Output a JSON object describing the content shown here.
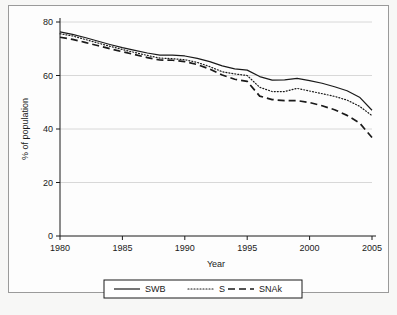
{
  "chart_data": {
    "type": "line",
    "title": "",
    "xlabel": "Year",
    "ylabel": "% of population",
    "xlim": [
      1980,
      2005
    ],
    "ylim": [
      0,
      80
    ],
    "xticks": [
      1980,
      1985,
      1990,
      1995,
      2000,
      2005
    ],
    "yticks": [
      0,
      20,
      40,
      60,
      80
    ],
    "grid": true,
    "grid_axis": "y",
    "legend_position": "below-plot",
    "x": [
      1980,
      1981,
      1982,
      1983,
      1984,
      1985,
      1986,
      1987,
      1988,
      1989,
      1990,
      1991,
      1992,
      1993,
      1994,
      1995,
      1996,
      1997,
      1998,
      1999,
      2000,
      2001,
      2002,
      2003,
      2004,
      2005
    ],
    "series": [
      {
        "name": "SWB",
        "style": "solid",
        "color": "#1a1a1a",
        "values": [
          76.3,
          75.4,
          74.2,
          72.9,
          71.6,
          70.4,
          69.4,
          68.4,
          67.6,
          67.6,
          67.3,
          66.4,
          65.2,
          63.6,
          62.5,
          62.0,
          59.6,
          58.3,
          58.4,
          58.9,
          58.1,
          57.1,
          55.8,
          54.3,
          51.9,
          47.0
        ]
      },
      {
        "name": "S",
        "style": "dotted",
        "color": "#1a1a1a",
        "values": [
          75.6,
          74.8,
          73.5,
          72.2,
          70.9,
          69.7,
          68.6,
          67.5,
          66.5,
          66.3,
          65.9,
          64.9,
          63.3,
          61.4,
          60.6,
          60.0,
          55.6,
          54.0,
          54.0,
          55.2,
          54.2,
          53.2,
          52.2,
          50.8,
          48.5,
          45.0
        ]
      },
      {
        "name": "SNAk",
        "style": "dashed",
        "color": "#1a1a1a",
        "values": [
          74.3,
          73.5,
          72.4,
          71.2,
          70.0,
          68.9,
          67.8,
          66.7,
          65.8,
          65.7,
          65.2,
          64.1,
          62.4,
          60.2,
          58.6,
          57.8,
          52.3,
          51.0,
          50.6,
          50.6,
          49.9,
          48.7,
          47.2,
          45.1,
          42.3,
          36.8
        ]
      }
    ]
  },
  "legend": {
    "items": [
      {
        "label": "SWB",
        "style": "solid"
      },
      {
        "label": "S",
        "style": "dotted"
      },
      {
        "label": "SNAk",
        "style": "dashed"
      }
    ]
  }
}
